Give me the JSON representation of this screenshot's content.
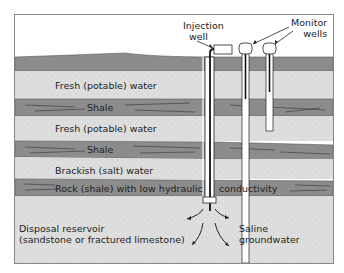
{
  "diagram": {
    "callouts": {
      "injection_well": [
        "Injection",
        "well"
      ],
      "monitor_wells": [
        "Monitor",
        "wells"
      ]
    },
    "layers": [
      {
        "id": "surface",
        "label": ""
      },
      {
        "id": "fresh1",
        "label": "Fresh (potable) water"
      },
      {
        "id": "shale1",
        "label": "Shale"
      },
      {
        "id": "fresh2",
        "label": "Fresh (potable) water"
      },
      {
        "id": "shale2",
        "label": "Shale"
      },
      {
        "id": "brackish",
        "label": "Brackish (salt) water"
      },
      {
        "id": "rock",
        "label_left": "Rock (shale) with low hydraulic",
        "label_right": "conductivity"
      },
      {
        "id": "disposal",
        "label": [
          "Disposal reservoir",
          "(sandstone or fractured limestone)"
        ]
      }
    ],
    "flow_label": [
      "Saline",
      "groundwater"
    ],
    "colors": {
      "shale": "#8c8c8c",
      "aquifer": "#dcdcdc",
      "line": "#222222",
      "pipe": "#ffffff"
    }
  }
}
